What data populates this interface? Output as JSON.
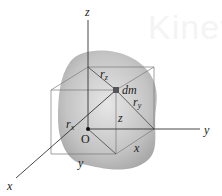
{
  "diagram": {
    "watermark": "Kinetics",
    "axes": {
      "x": "x",
      "y": "y",
      "z": "z"
    },
    "origin": "O",
    "element": "dm",
    "distances": {
      "rx": "r",
      "rx_sub": "x",
      "ry": "r",
      "ry_sub": "y",
      "rz": "r",
      "rz_sub": "z"
    },
    "coordinates": {
      "x": "x",
      "y": "y",
      "z": "z"
    },
    "colors": {
      "body_fill": "#bdbdbd",
      "lines": "#333333",
      "box_lines": "#777777",
      "dm": "#555555"
    }
  }
}
